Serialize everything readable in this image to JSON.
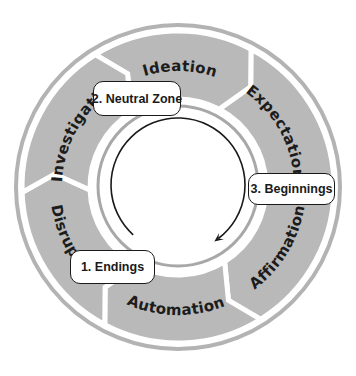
{
  "diagram": {
    "center": [
      178,
      187
    ],
    "colors": {
      "segment_fill": "#b9b9b9",
      "outer_ring": "#b3b3b3",
      "inner_ring": "#a8a8a8",
      "arrow": "#1a1a1a",
      "text": "#1c1c1c"
    },
    "segments": [
      {
        "label": "Ideation",
        "start": 328,
        "end": 28,
        "label_dir": "cw"
      },
      {
        "label": "Expectation",
        "start": 28,
        "end": 88,
        "label_dir": "cw"
      },
      {
        "label": "Affirmation",
        "start": 88,
        "end": 148,
        "label_dir": "ccw"
      },
      {
        "label": "Automation",
        "start": 148,
        "end": 208,
        "label_dir": "ccw"
      },
      {
        "label": "Disruption",
        "start": 208,
        "end": 268,
        "label_dir": "ccw"
      },
      {
        "label": "Investigation",
        "start": 268,
        "end": 328,
        "label_dir": "cw"
      }
    ],
    "stages": [
      {
        "label": "1. Endings",
        "x": 70,
        "y": 250,
        "w": 85,
        "h": 34
      },
      {
        "label": "2. Neutral Zone",
        "x": 93,
        "y": 81,
        "w": 88,
        "h": 35
      },
      {
        "label": "3. Beginnings",
        "x": 248,
        "y": 173,
        "w": 87,
        "h": 32
      }
    ]
  }
}
